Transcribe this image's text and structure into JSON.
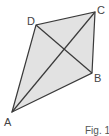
{
  "figure": {
    "caption": "Fig. 1",
    "fill_color": "#e2e2e2",
    "stroke_color": "#3a3a3a",
    "vertices": [
      {
        "label": "A",
        "x": 12,
        "y": 112
      },
      {
        "label": "B",
        "x": 92,
        "y": 73
      },
      {
        "label": "C",
        "x": 95,
        "y": 12
      },
      {
        "label": "D",
        "x": 36,
        "y": 25
      }
    ],
    "edges": [
      "AB",
      "BC",
      "CD",
      "DA"
    ],
    "diagonals": [
      "AC",
      "DB"
    ]
  }
}
